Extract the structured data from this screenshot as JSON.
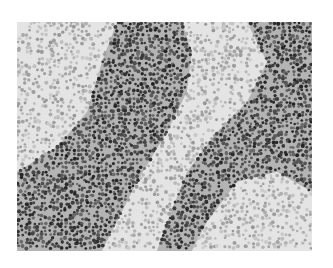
{
  "image": {
    "kind": "grayscale histology micrograph",
    "description": "Dense lymphoid tissue: dark band of tightly packed small lymphocytes running diagonally, with paler germinal-center-like regions at upper-left and lower-right and a pale stromal channel between",
    "frame": {
      "x": 17,
      "y": 22,
      "width": 295,
      "height": 229
    },
    "background_color": "#ffffff",
    "tissue_base_color": "#dcdcdc",
    "regions": [
      {
        "name": "pale-upper-left",
        "shade": "light",
        "polygon": [
          [
            0,
            0
          ],
          [
            100,
            0
          ],
          [
            85,
            40
          ],
          [
            70,
            90
          ],
          [
            40,
            125
          ],
          [
            0,
            150
          ]
        ]
      },
      {
        "name": "dark-band-main",
        "shade": "dark",
        "polygon": [
          [
            100,
            0
          ],
          [
            165,
            0
          ],
          [
            175,
            30
          ],
          [
            170,
            70
          ],
          [
            150,
            110
          ],
          [
            120,
            160
          ],
          [
            100,
            200
          ],
          [
            85,
            229
          ],
          [
            0,
            229
          ],
          [
            0,
            150
          ],
          [
            40,
            125
          ],
          [
            70,
            90
          ],
          [
            85,
            40
          ]
        ]
      },
      {
        "name": "pale-channel",
        "shade": "light",
        "polygon": [
          [
            165,
            0
          ],
          [
            230,
            0
          ],
          [
            250,
            40
          ],
          [
            230,
            80
          ],
          [
            200,
            110
          ],
          [
            170,
            150
          ],
          [
            150,
            200
          ],
          [
            140,
            229
          ],
          [
            85,
            229
          ],
          [
            100,
            200
          ],
          [
            120,
            160
          ],
          [
            150,
            110
          ],
          [
            170,
            70
          ],
          [
            175,
            30
          ]
        ]
      },
      {
        "name": "dark-band-right",
        "shade": "dark",
        "polygon": [
          [
            230,
            0
          ],
          [
            295,
            0
          ],
          [
            295,
            170
          ],
          [
            260,
            150
          ],
          [
            220,
            160
          ],
          [
            190,
            200
          ],
          [
            175,
            229
          ],
          [
            140,
            229
          ],
          [
            150,
            200
          ],
          [
            170,
            150
          ],
          [
            200,
            110
          ],
          [
            230,
            80
          ],
          [
            250,
            40
          ]
        ]
      },
      {
        "name": "pale-lower-right",
        "shade": "light",
        "polygon": [
          [
            175,
            229
          ],
          [
            190,
            200
          ],
          [
            220,
            160
          ],
          [
            260,
            150
          ],
          [
            295,
            170
          ],
          [
            295,
            229
          ]
        ]
      }
    ],
    "shades": {
      "light": {
        "cell_density": 0.55,
        "cell_gray_min": 150,
        "cell_gray_max": 205
      },
      "dark": {
        "cell_density": 0.9,
        "cell_gray_min": 35,
        "cell_gray_max": 110
      }
    }
  }
}
